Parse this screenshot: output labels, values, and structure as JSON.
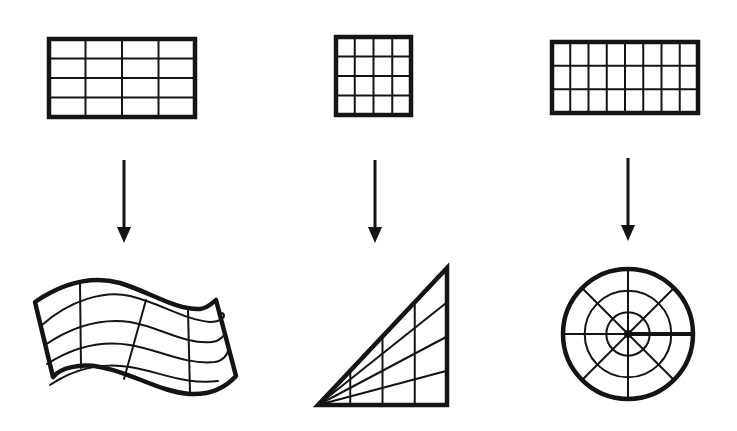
{
  "diagram": {
    "stroke_color": "#141414",
    "background": "#ffffff",
    "columns": [
      {
        "id": "wave",
        "source_grid": {
          "x": 49,
          "y": 39,
          "width": 146,
          "height": 78,
          "cols": 4,
          "rows": 4
        },
        "arrow": {
          "x": 124,
          "y1": 160,
          "y2": 243
        },
        "target_shape": "wavy-quadrilateral",
        "target_grid": {
          "cols": 4,
          "rows": 4
        }
      },
      {
        "id": "triangle",
        "source_grid": {
          "x": 336,
          "y": 37,
          "width": 75,
          "height": 78,
          "cols": 4,
          "rows": 4
        },
        "arrow": {
          "x": 375,
          "y1": 160,
          "y2": 243
        },
        "target_shape": "right-triangle",
        "target_grid": {
          "cols": 4,
          "rows": 4
        }
      },
      {
        "id": "circle",
        "source_grid": {
          "x": 552,
          "y": 42,
          "width": 146,
          "height": 71,
          "cols": 8,
          "rows": 3
        },
        "arrow": {
          "x": 628,
          "y1": 158,
          "y2": 241
        },
        "target_shape": "polar-disk",
        "target_grid": {
          "sectors": 8,
          "rings": 3
        }
      }
    ]
  }
}
